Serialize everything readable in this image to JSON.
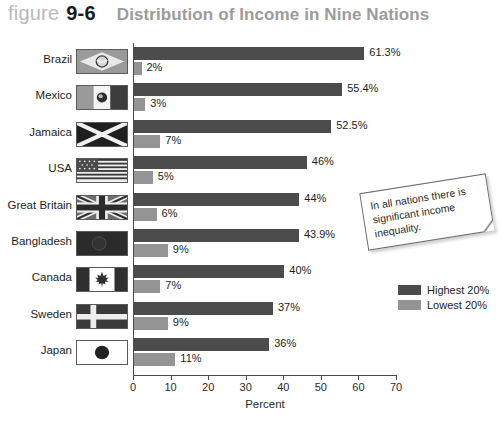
{
  "header": {
    "figure_word": "figure",
    "figure_number": "9-6",
    "title": "Distribution of Income in Nine Nations"
  },
  "note": {
    "text": "In all nations there is significant income inequality."
  },
  "legend": {
    "position": "right",
    "items": [
      {
        "label": "Highest 20%",
        "color": "#4c4c4c",
        "swatch_name": "legend-swatch-highest"
      },
      {
        "label": "Lowest 20%",
        "color": "#949494",
        "swatch_name": "legend-swatch-lowest"
      }
    ]
  },
  "axis": {
    "ticks": [
      "0",
      "10",
      "20",
      "30",
      "40",
      "50",
      "60",
      "70"
    ],
    "title": "Percent"
  },
  "chart_data": {
    "type": "bar",
    "orientation": "horizontal",
    "title": "Distribution of Income in Nine Nations",
    "xlabel": "Percent",
    "ylabel": "",
    "xlim": [
      0,
      70
    ],
    "xticks": [
      0,
      10,
      20,
      30,
      40,
      50,
      60,
      70
    ],
    "grid": false,
    "legend_position": "right",
    "categories": [
      "Brazil",
      "Mexico",
      "Jamaica",
      "USA",
      "Great Britain",
      "Bangladesh",
      "Canada",
      "Sweden",
      "Japan"
    ],
    "series": [
      {
        "name": "Highest 20%",
        "color": "#4c4c4c",
        "values": [
          61.3,
          55.4,
          52.5,
          46,
          44,
          43.9,
          40,
          37,
          36
        ],
        "labels": [
          "61.3%",
          "55.4%",
          "52.5%",
          "46%",
          "44%",
          "43.9%",
          "40%",
          "37%",
          "36%"
        ]
      },
      {
        "name": "Lowest 20%",
        "color": "#949494",
        "values": [
          2,
          3,
          7,
          5,
          6,
          9,
          7,
          9,
          11
        ],
        "labels": [
          "2%",
          "3%",
          "7%",
          "5%",
          "6%",
          "9%",
          "7%",
          "9%",
          "11%"
        ]
      }
    ],
    "flags": [
      "brazil",
      "mexico",
      "jamaica",
      "usa",
      "great-britain",
      "bangladesh",
      "canada",
      "sweden",
      "japan"
    ]
  }
}
